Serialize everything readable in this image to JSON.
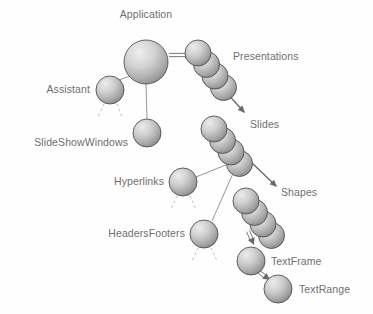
{
  "diagram": {
    "type": "object-model-hierarchy",
    "background_color": "#fefefe",
    "label_color": "#6f6f6f",
    "sphere_light_color": "#e8e8e8",
    "sphere_mid_color": "#bdbdbd",
    "sphere_dark_color": "#8e8e8e",
    "sphere_outline_color": "#4a4a4a",
    "connector_color": "#8a8a8a",
    "arrow_color": "#6a6a6a",
    "dashed_color": "#b6b6b6",
    "nodes": [
      {
        "id": "application",
        "label": "Application",
        "kind": "single",
        "cx": 146,
        "cy": 62,
        "r": 22,
        "label_x": 146,
        "label_y": 18,
        "label_anchor": "middle"
      },
      {
        "id": "presentations",
        "label": "Presentations",
        "kind": "collection",
        "count": 4,
        "cx": 198,
        "cy": 53,
        "r": 13,
        "step_x": 8.5,
        "step_y": 11.5,
        "label_x": 233,
        "label_y": 60,
        "label_anchor": "start"
      },
      {
        "id": "slides",
        "label": "Slides",
        "kind": "collection",
        "count": 4,
        "cx": 214,
        "cy": 129,
        "r": 13,
        "step_x": 8.5,
        "step_y": 11.5,
        "label_x": 250,
        "label_y": 128,
        "label_anchor": "start"
      },
      {
        "id": "shapes",
        "label": "Shapes",
        "kind": "collection",
        "count": 4,
        "cx": 246,
        "cy": 201,
        "r": 13,
        "step_x": 8.5,
        "step_y": 11.5,
        "label_x": 281,
        "label_y": 196,
        "label_anchor": "start"
      },
      {
        "id": "assistant",
        "label": "Assistant",
        "kind": "single",
        "cx": 110,
        "cy": 90,
        "r": 14,
        "label_x": 90,
        "label_y": 93,
        "label_anchor": "end"
      },
      {
        "id": "slideshowwindows",
        "label": "SlideShowWindows",
        "kind": "single",
        "cx": 147,
        "cy": 133,
        "r": 14,
        "label_x": 128,
        "label_y": 146,
        "label_anchor": "end"
      },
      {
        "id": "hyperlinks",
        "label": "Hyperlinks",
        "kind": "single",
        "cx": 183,
        "cy": 182,
        "r": 14,
        "label_x": 164,
        "label_y": 185,
        "label_anchor": "end"
      },
      {
        "id": "headersfooters",
        "label": "HeadersFooters",
        "kind": "single",
        "cx": 204,
        "cy": 234,
        "r": 14,
        "label_x": 185,
        "label_y": 237,
        "label_anchor": "end"
      },
      {
        "id": "textframe",
        "label": "TextFrame",
        "kind": "single",
        "cx": 251,
        "cy": 261,
        "r": 14,
        "label_x": 271,
        "label_y": 265,
        "label_anchor": "start"
      },
      {
        "id": "textrange",
        "label": "TextRange",
        "kind": "single",
        "cx": 278,
        "cy": 289,
        "r": 14,
        "label_x": 299,
        "label_y": 293,
        "label_anchor": "start"
      }
    ],
    "connectors": [
      {
        "id": "application-to-presentations",
        "from": "application",
        "to": "presentations",
        "style": "double-arrow",
        "x1": 169,
        "y1": 55,
        "x2": 192,
        "y2": 55
      },
      {
        "id": "application-to-assistant",
        "from": "application",
        "to": "assistant",
        "style": "plain-line",
        "x1": 130,
        "y1": 76,
        "x2": 119,
        "y2": 80
      },
      {
        "id": "application-to-slideshowwindows",
        "from": "application",
        "to": "slideshowwindows",
        "style": "plain-line",
        "x1": 146,
        "y1": 84,
        "x2": 147,
        "y2": 119
      },
      {
        "id": "presentations-to-slides",
        "from": "presentations",
        "to": "slides",
        "style": "solid-arrow",
        "x1": 224,
        "y1": 90,
        "x2": 244,
        "y2": 112
      },
      {
        "id": "presentations-stem",
        "from": "presentations",
        "to": "slides",
        "style": "plain-line",
        "x1": 223,
        "y1": 78,
        "x2": 223,
        "y2": 92
      },
      {
        "id": "slides-to-shapes",
        "from": "slides",
        "to": "shapes",
        "style": "solid-arrow",
        "x1": 252,
        "y1": 163,
        "x2": 276,
        "y2": 186
      },
      {
        "id": "slides-to-hyperlinks",
        "from": "slides",
        "to": "hyperlinks",
        "style": "plain-line",
        "x1": 238,
        "y1": 160,
        "x2": 196,
        "y2": 177
      },
      {
        "id": "slides-to-headersfooters",
        "from": "slides",
        "to": "headersfooters",
        "style": "plain-line",
        "x1": 238,
        "y1": 162,
        "x2": 212,
        "y2": 221
      },
      {
        "id": "shapes-to-textframe",
        "from": "shapes",
        "to": "textframe",
        "style": "double-arrow",
        "x1": 248,
        "y1": 231,
        "x2": 254,
        "y2": 245
      },
      {
        "id": "textframe-to-textrange",
        "from": "textframe",
        "to": "textrange",
        "style": "double-arrow",
        "x1": 259,
        "y1": 272,
        "x2": 270,
        "y2": 280
      }
    ],
    "dashed_stubs": [
      {
        "id": "assistant-stub-left",
        "parent": "assistant",
        "x1": 104,
        "y1": 104,
        "x2": 98,
        "y2": 117
      },
      {
        "id": "assistant-stub-right",
        "parent": "assistant",
        "x1": 117,
        "y1": 104,
        "x2": 122,
        "y2": 117
      },
      {
        "id": "hyperlinks-stub-left",
        "parent": "hyperlinks",
        "x1": 177,
        "y1": 196,
        "x2": 171,
        "y2": 209
      },
      {
        "id": "hyperlinks-stub-right",
        "parent": "hyperlinks",
        "x1": 190,
        "y1": 196,
        "x2": 196,
        "y2": 209
      },
      {
        "id": "headersfooters-stub-left",
        "parent": "headersfooters",
        "x1": 198,
        "y1": 248,
        "x2": 192,
        "y2": 261
      },
      {
        "id": "headersfooters-stub-right",
        "parent": "headersfooters",
        "x1": 211,
        "y1": 248,
        "x2": 217,
        "y2": 261
      }
    ]
  }
}
